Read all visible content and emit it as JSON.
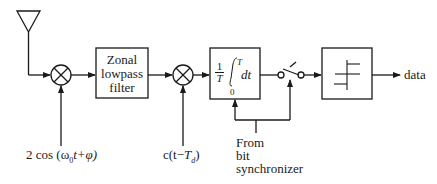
{
  "diagram": {
    "title": "",
    "blocks": [
      {
        "id": "antenna",
        "type": "antenna"
      },
      {
        "id": "mixer1",
        "type": "multiplier",
        "input_label": "2 cos (ω₀t+φ)"
      },
      {
        "id": "zonal_lpf",
        "type": "box",
        "label_lines": [
          "Zonal",
          "lowpass",
          "filter"
        ]
      },
      {
        "id": "mixer2",
        "type": "multiplier",
        "input_label": "c(t−T̂d)"
      },
      {
        "id": "integrator",
        "type": "box",
        "label": "(1/T)∫₀ᵀ dt",
        "frac_num": "1",
        "frac_den": "T",
        "upper_limit": "T",
        "lower_limit": "0",
        "diff": "dt"
      },
      {
        "id": "sampler_switch",
        "type": "switch"
      },
      {
        "id": "threshold",
        "type": "box",
        "label": "threshold detector"
      },
      {
        "id": "output",
        "type": "output",
        "label": "data"
      }
    ],
    "labels": {
      "mixer1_input": "2 cos (ω",
      "mixer1_sub": "0",
      "mixer1_tail": "t+φ)",
      "mixer2_input_pre": "c(t−",
      "mixer2_T": "T",
      "mixer2_sub": "d",
      "mixer2_tail": ")",
      "sync_line1": "From",
      "sync_line2": "bit",
      "sync_line3": "synchronizer",
      "lpf_line1": "Zonal",
      "lpf_line2": "lowpass",
      "lpf_line3": "filter",
      "int_num": "1",
      "int_den": "T",
      "int_upper": "T",
      "int_lower": "0",
      "int_dt": "dt",
      "output": "data"
    },
    "colors": {
      "stroke": "#1a1a1a",
      "background": "#ffffff"
    }
  }
}
